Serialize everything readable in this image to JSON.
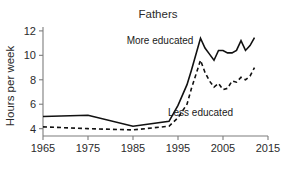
{
  "chart_data": {
    "type": "line",
    "title": "Fathers",
    "xlabel": "",
    "ylabel": "Hours per week",
    "xlim": [
      1965,
      2015
    ],
    "ylim": [
      3.4,
      12.4
    ],
    "grid": false,
    "legend_position": "inline-annotations",
    "x_ticks": [
      "1965",
      "1975",
      "1985",
      "1995",
      "2005",
      "2015"
    ],
    "x_tick_values": [
      1965,
      1975,
      1985,
      1995,
      2005,
      2015
    ],
    "y_ticks": [
      "4",
      "6",
      "8",
      "10",
      "12"
    ],
    "y_tick_values": [
      4,
      6,
      8,
      10,
      12
    ],
    "annotations": [
      {
        "text": "More educated",
        "x": 1991,
        "y": 10.9
      },
      {
        "text": "Less educated",
        "x": 2000,
        "y": 5.0
      }
    ],
    "series": [
      {
        "name": "More educated",
        "style": "solid",
        "color": "#111111",
        "x": [
          1965,
          1975,
          1985,
          1993,
          1995,
          1997,
          1998,
          2000,
          2001,
          2002,
          2003,
          2004,
          2005,
          2006,
          2007,
          2008,
          2009,
          2010,
          2011,
          2012
        ],
        "values": [
          5.0,
          5.1,
          4.2,
          4.6,
          5.9,
          7.6,
          8.8,
          11.4,
          10.6,
          10.1,
          9.6,
          10.4,
          10.4,
          10.2,
          10.2,
          10.4,
          11.2,
          10.4,
          10.8,
          11.45
        ]
      },
      {
        "name": "Less educated",
        "style": "dashed",
        "color": "#111111",
        "x": [
          1965,
          1975,
          1985,
          1993,
          1995,
          1997,
          1998,
          2000,
          2001,
          2002,
          2003,
          2004,
          2005,
          2006,
          2007,
          2008,
          2009,
          2010,
          2011,
          2012
        ],
        "values": [
          4.15,
          4.0,
          3.9,
          4.2,
          4.9,
          6.0,
          7.3,
          9.6,
          8.6,
          7.9,
          7.4,
          7.7,
          7.2,
          7.3,
          7.9,
          7.8,
          8.2,
          8.0,
          8.3,
          9.0
        ]
      }
    ]
  }
}
